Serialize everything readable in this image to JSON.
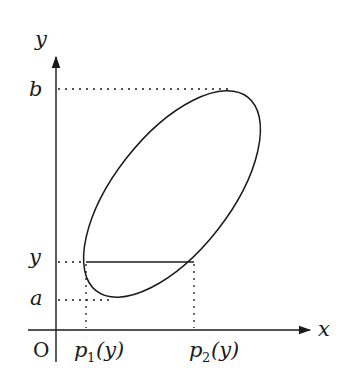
{
  "diagram": {
    "axes": {
      "x_label": "x",
      "y_label": "y",
      "origin_label": "O"
    },
    "y_ticks": {
      "top": "b",
      "middle": "y",
      "bottom": "a"
    },
    "x_ticks": {
      "left": "p",
      "left_sub": "1",
      "left_arg": "(y)",
      "right": "p",
      "right_sub": "2",
      "right_arg": "(y)"
    },
    "shape": "tilted ellipse region",
    "colors": {
      "stroke": "#1a1a1a",
      "background": "#ffffff"
    }
  }
}
